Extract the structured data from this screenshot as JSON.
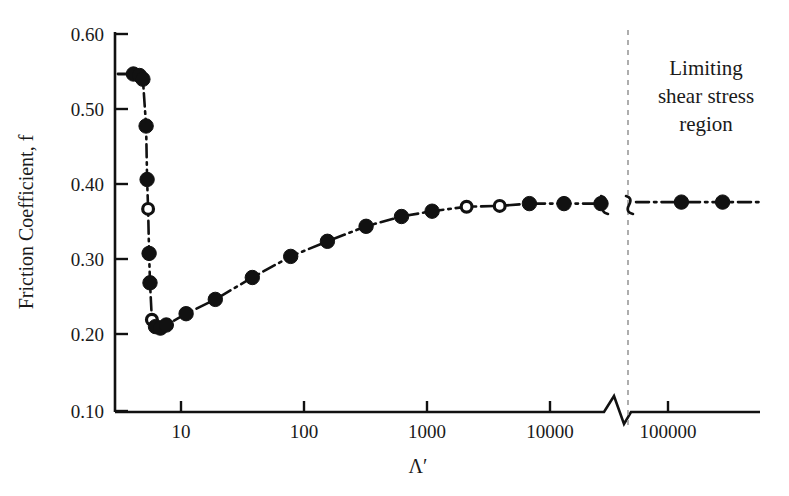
{
  "figure": {
    "background_color": "#ffffff",
    "ink_color": "#111111",
    "divider_color": "#9a9a9a"
  },
  "annotations": {
    "limiting_region": {
      "line1": "Limiting",
      "line2": "shear stress",
      "line3": "region"
    }
  },
  "chart_data": {
    "type": "line",
    "title": "",
    "xlabel": "Λ′",
    "ylabel": "Friction Coefficient, f",
    "xscale": "log",
    "yscale": "linear",
    "ylim": [
      0.1,
      0.6
    ],
    "xlim": [
      3.5,
      400000
    ],
    "grid": false,
    "legend": false,
    "axis_break": {
      "present": true,
      "x_start": 28000,
      "x_end": 52000,
      "note": "zigzag break on x-axis and brace break in curve"
    },
    "x_ticks": [
      10,
      100,
      1000,
      10000,
      100000
    ],
    "x_tick_labels": [
      "10",
      "100",
      "1000",
      "10000",
      "100000"
    ],
    "y_ticks": [
      0.1,
      0.2,
      0.3,
      0.4,
      0.5,
      0.6
    ],
    "y_tick_labels": [
      "0.10",
      "0.20",
      "0.30",
      "0.40",
      "0.50",
      "0.60"
    ],
    "series": [
      {
        "name": "Friction coefficient vs lambda-prime",
        "marker": "circle",
        "linestyle": "dash-dot",
        "points": [
          {
            "x": 4.1,
            "y": 0.547,
            "marker": "filled"
          },
          {
            "x": 4.6,
            "y": 0.545,
            "marker": "filled"
          },
          {
            "x": 4.9,
            "y": 0.54,
            "marker": "filled"
          },
          {
            "x": 5.2,
            "y": 0.478,
            "marker": "filled"
          },
          {
            "x": 5.3,
            "y": 0.407,
            "marker": "filled"
          },
          {
            "x": 5.4,
            "y": 0.368,
            "marker": "open"
          },
          {
            "x": 5.5,
            "y": 0.309,
            "marker": "filled"
          },
          {
            "x": 5.6,
            "y": 0.27,
            "marker": "filled"
          },
          {
            "x": 5.8,
            "y": 0.221,
            "marker": "open"
          },
          {
            "x": 6.2,
            "y": 0.212,
            "marker": "filled"
          },
          {
            "x": 6.8,
            "y": 0.21,
            "marker": "filled"
          },
          {
            "x": 7.6,
            "y": 0.214,
            "marker": "filled"
          },
          {
            "x": 11.0,
            "y": 0.229,
            "marker": "filled"
          },
          {
            "x": 19.0,
            "y": 0.248,
            "marker": "filled"
          },
          {
            "x": 38.0,
            "y": 0.277,
            "marker": "filled"
          },
          {
            "x": 78.0,
            "y": 0.305,
            "marker": "filled"
          },
          {
            "x": 155.0,
            "y": 0.325,
            "marker": "filled"
          },
          {
            "x": 320.0,
            "y": 0.345,
            "marker": "filled"
          },
          {
            "x": 620.0,
            "y": 0.358,
            "marker": "filled"
          },
          {
            "x": 1100.0,
            "y": 0.365,
            "marker": "filled"
          },
          {
            "x": 2100.0,
            "y": 0.371,
            "marker": "open"
          },
          {
            "x": 3900.0,
            "y": 0.372,
            "marker": "open"
          },
          {
            "x": 6800.0,
            "y": 0.375,
            "marker": "filled"
          },
          {
            "x": 13000.0,
            "y": 0.375,
            "marker": "filled"
          },
          {
            "x": 26000.0,
            "y": 0.375,
            "marker": "filled"
          },
          {
            "x": 130000.0,
            "y": 0.377,
            "marker": "filled"
          },
          {
            "x": 290000.0,
            "y": 0.377,
            "marker": "filled"
          }
        ]
      }
    ]
  }
}
